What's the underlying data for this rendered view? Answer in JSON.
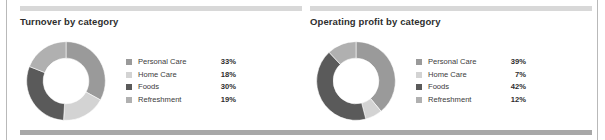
{
  "frame": {
    "edge_rule_color": "#b9b9b9",
    "footer_band_color": "#a8a8a8",
    "panel_topbar_color": "#d8d8d8",
    "background": "#ffffff"
  },
  "palette": {
    "personal_care": "#9a9a9a",
    "home_care": "#d3d3d3",
    "foods": "#5a5a5a",
    "refreshment": "#b0b0b0"
  },
  "panels": [
    {
      "title": "Turnover by category",
      "legend": [
        {
          "label": "Personal Care",
          "value": "33%"
        },
        {
          "label": "Home Care",
          "value": "18%"
        },
        {
          "label": "Foods",
          "value": "30%"
        },
        {
          "label": "Refreshment",
          "value": "19%"
        }
      ]
    },
    {
      "title": "Operating profit by category",
      "legend": [
        {
          "label": "Personal Care",
          "value": "39%"
        },
        {
          "label": "Home Care",
          "value": "7%"
        },
        {
          "label": "Foods",
          "value": "42%"
        },
        {
          "label": "Refreshment",
          "value": "12%"
        }
      ]
    }
  ],
  "chart_data": [
    {
      "type": "pie",
      "variant": "donut",
      "title": "Turnover by category",
      "categories": [
        "Personal Care",
        "Home Care",
        "Foods",
        "Refreshment"
      ],
      "values": [
        33,
        18,
        30,
        19
      ],
      "unit": "%",
      "colors": [
        "#9a9a9a",
        "#d3d3d3",
        "#5a5a5a",
        "#b0b0b0"
      ],
      "start_angle": 0,
      "direction": "clockwise",
      "inner_radius_ratio": 0.58,
      "legend_position": "right",
      "grid": false
    },
    {
      "type": "pie",
      "variant": "donut",
      "title": "Operating profit by category",
      "categories": [
        "Personal Care",
        "Home Care",
        "Foods",
        "Refreshment"
      ],
      "values": [
        39,
        7,
        42,
        12
      ],
      "unit": "%",
      "colors": [
        "#9a9a9a",
        "#d3d3d3",
        "#5a5a5a",
        "#b0b0b0"
      ],
      "start_angle": 0,
      "direction": "clockwise",
      "inner_radius_ratio": 0.58,
      "legend_position": "right",
      "grid": false
    }
  ]
}
